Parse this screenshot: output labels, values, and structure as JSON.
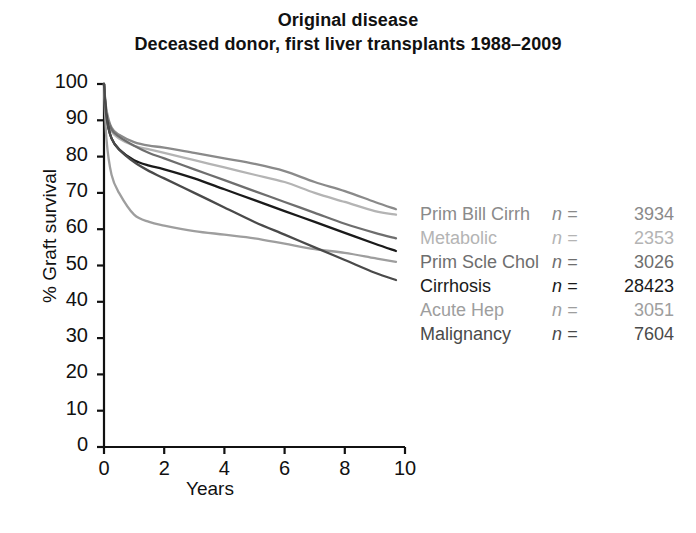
{
  "title": {
    "line1": "Original disease",
    "line2": "Deceased donor, first liver transplants 1988–2009"
  },
  "axes": {
    "ylabel": "% Graft survival",
    "xlabel": "Years"
  },
  "legend": [
    {
      "label": "Prim Bill Cirrh",
      "eq": "n =",
      "n": "3934",
      "color": "#8a8a8a"
    },
    {
      "label": "Metabolic",
      "eq": "n =",
      "n": "2353",
      "color": "#b4b4b4"
    },
    {
      "label": "Prim Scle Chol",
      "eq": "n =",
      "n": "3026",
      "color": "#6e6e6e"
    },
    {
      "label": "Cirrhosis",
      "eq": "n =",
      "n": "28423",
      "color": "#1a1a1a"
    },
    {
      "label": "Acute Hep",
      "eq": "n =",
      "n": "3051",
      "color": "#9e9e9e"
    },
    {
      "label": "Malignancy",
      "eq": "n =",
      "n": "7604",
      "color": "#4a4a4a"
    }
  ],
  "chart_data": {
    "type": "line",
    "xlabel": "Years",
    "ylabel": "% Graft survival",
    "xlim": [
      0,
      10
    ],
    "ylim": [
      0,
      100
    ],
    "xticks": [
      0,
      2,
      4,
      6,
      8,
      10
    ],
    "yticks": [
      0,
      10,
      20,
      30,
      40,
      50,
      60,
      70,
      80,
      90,
      100
    ],
    "grid": false,
    "legend_position": "right",
    "x": [
      0,
      0.08,
      0.25,
      0.5,
      1,
      1.5,
      2,
      3,
      4,
      5,
      6,
      7,
      8,
      9,
      9.7
    ],
    "series": [
      {
        "name": "Prim Bill Cirrh",
        "n": 3934,
        "color": "#8a8a8a",
        "values": [
          100,
          93,
          88,
          86,
          84,
          83,
          82.5,
          81,
          79.5,
          78,
          76,
          73,
          70.5,
          67.5,
          65.5
        ]
      },
      {
        "name": "Metabolic",
        "n": 2353,
        "color": "#b4b4b4",
        "values": [
          100,
          92,
          87,
          85,
          83,
          82,
          81,
          79,
          77,
          75,
          73,
          70,
          67.5,
          65,
          64
        ]
      },
      {
        "name": "Prim Scle Chol",
        "n": 3026,
        "color": "#6e6e6e",
        "values": [
          100,
          92,
          87.5,
          85.5,
          83,
          81,
          79.5,
          76.5,
          73.5,
          70.5,
          67.5,
          64.5,
          61.5,
          59,
          57.5
        ]
      },
      {
        "name": "Cirrhosis",
        "n": 28423,
        "color": "#1a1a1a",
        "values": [
          100,
          91,
          85,
          82,
          79,
          77.5,
          76.5,
          74,
          71,
          68,
          65,
          62,
          59,
          56,
          54
        ]
      },
      {
        "name": "Acute Hep",
        "n": 3051,
        "color": "#9e9e9e",
        "values": [
          100,
          85,
          75,
          70,
          64,
          62,
          61,
          59.5,
          58.5,
          57.5,
          56,
          54.5,
          53.5,
          52,
          51
        ]
      },
      {
        "name": "Malignancy",
        "n": 7604,
        "color": "#4a4a4a",
        "values": [
          100,
          91,
          85,
          82,
          78.5,
          76,
          74,
          70,
          66,
          62,
          58.5,
          55,
          51.5,
          48,
          46
        ]
      }
    ]
  }
}
